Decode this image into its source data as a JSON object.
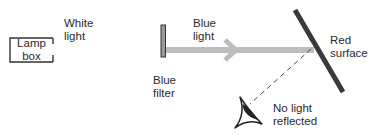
{
  "diagram": {
    "lamp_box": {
      "line1": "Lamp",
      "line2": "box"
    },
    "white_light": {
      "line1": "White",
      "line2": "light"
    },
    "blue_light": {
      "line1": "Blue",
      "line2": "light"
    },
    "blue_filter": {
      "line1": "Blue",
      "line2": "filter"
    },
    "red_surface": {
      "line1": "Red",
      "line2": "surface"
    },
    "no_light_reflected": {
      "line1": "No light",
      "line2": "reflected"
    }
  },
  "colors": {
    "beam": "#bdbdbd",
    "filter_fill": "#9a9a9a",
    "surface": "#3a3a3a",
    "outline": "#333333"
  },
  "icons": {
    "eye": "eye-icon"
  }
}
